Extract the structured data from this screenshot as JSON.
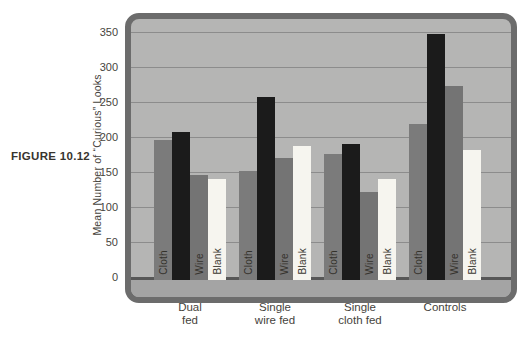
{
  "figure_label": "FIGURE 10.12",
  "chart_data": {
    "type": "bar",
    "title": "",
    "xlabel": "",
    "ylabel": "Mean Number of “Curious” Looks",
    "yticks": [
      0,
      50,
      100,
      150,
      200,
      250,
      300,
      350
    ],
    "ylim": [
      0,
      380
    ],
    "grid": true,
    "legend_position": "none",
    "bar_series_labels": [
      "Cloth",
      "",
      "Wire",
      "Blank"
    ],
    "bar_series_colors": [
      "#7b7b7b",
      "#1b1b1b",
      "#747474",
      "#f6f5ef"
    ],
    "bar_label_colors": [
      "#34322c",
      "#242424",
      "#34322c",
      "#3a3831"
    ],
    "categories": [
      "Dual fed",
      "Single wire fed",
      "Single cloth fed",
      "Controls"
    ],
    "groups": [
      {
        "label_line1": "Dual",
        "label_line2": "fed",
        "bars": [
          {
            "label": "Cloth",
            "value": 200
          },
          {
            "label": "",
            "value": 212
          },
          {
            "label": "Wire",
            "value": 150
          },
          {
            "label": "Blank",
            "value": 145
          }
        ]
      },
      {
        "label_line1": "Single",
        "label_line2": "wire fed",
        "bars": [
          {
            "label": "Cloth",
            "value": 156
          },
          {
            "label": "",
            "value": 261
          },
          {
            "label": "Wire",
            "value": 174
          },
          {
            "label": "Blank",
            "value": 191
          }
        ]
      },
      {
        "label_line1": "Single",
        "label_line2": "cloth fed",
        "bars": [
          {
            "label": "Cloth",
            "value": 180
          },
          {
            "label": "",
            "value": 194
          },
          {
            "label": "Wire",
            "value": 126
          },
          {
            "label": "Blank",
            "value": 144
          }
        ]
      },
      {
        "label_line1": "Controls",
        "label_line2": "",
        "bars": [
          {
            "label": "Cloth",
            "value": 223
          },
          {
            "label": "",
            "value": 351
          },
          {
            "label": "Wire",
            "value": 277
          },
          {
            "label": "Blank",
            "value": 186
          }
        ]
      }
    ]
  },
  "colors": {
    "plot_background": "#b5b5b4",
    "frame_border": "#6c6c6c",
    "gridline": "#8c8c8c",
    "baseline": "#575757",
    "text": "#46433c"
  }
}
